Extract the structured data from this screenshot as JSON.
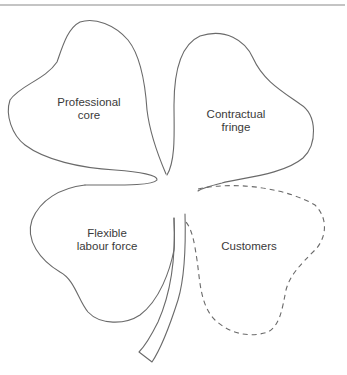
{
  "diagram": {
    "type": "shamrock-organisation",
    "leaves": [
      {
        "id": "professional-core",
        "line1": "Professional",
        "line2": "core",
        "style": "solid"
      },
      {
        "id": "contractual-fringe",
        "line1": "Contractual",
        "line2": "fringe",
        "style": "solid"
      },
      {
        "id": "flexible-labour-force",
        "line1": "Flexible",
        "line2": "labour force",
        "style": "solid"
      },
      {
        "id": "customers",
        "line1": "Customers",
        "line2": "",
        "style": "dashed"
      }
    ],
    "colors": {
      "stroke": "#6a6a6a",
      "text": "#3a3a3a",
      "background": "#ffffff"
    }
  }
}
